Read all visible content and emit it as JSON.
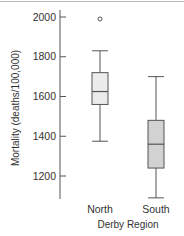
{
  "chart_data": {
    "type": "boxplot",
    "title": "",
    "xlabel": "Derby Region",
    "ylabel": "Mortality (deaths/100,000)",
    "ylim": [
      1080,
      2010
    ],
    "yticks": [
      1200,
      1400,
      1600,
      1800,
      2000
    ],
    "ytick_labels": [
      "1200",
      "1400",
      "1600",
      "1800",
      "2000"
    ],
    "grid": false,
    "legend": null,
    "categories": [
      "North",
      "South"
    ],
    "series": [
      {
        "name": "North",
        "whisker_low": 1375,
        "q1": 1560,
        "median": 1625,
        "q3": 1720,
        "whisker_high": 1830,
        "outliers": [
          1990
        ],
        "fill": "#ececec"
      },
      {
        "name": "South",
        "whisker_low": 1090,
        "q1": 1240,
        "median": 1360,
        "q3": 1480,
        "whisker_high": 1700,
        "outliers": [],
        "fill": "#d2d2d2"
      }
    ],
    "line_color": "#555555"
  }
}
